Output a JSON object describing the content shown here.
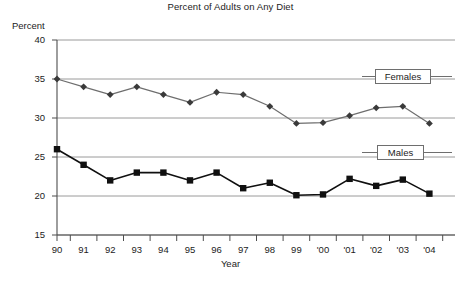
{
  "chart_data": {
    "type": "line",
    "title": "Percent of Adults on Any Diet",
    "xlabel": "Year",
    "ylabel": "Percent",
    "categories": [
      "90",
      "91",
      "92",
      "93",
      "94",
      "95",
      "96",
      "97",
      "98",
      "99",
      "'00",
      "'01",
      "'02",
      "'03",
      "'04"
    ],
    "ylim": [
      15,
      40
    ],
    "yticks": [
      15,
      20,
      25,
      30,
      35,
      40
    ],
    "ytick_labels": [
      "15",
      "20",
      "25",
      "30",
      "35",
      "40"
    ],
    "grid": "horizontal",
    "legend_position": "inline-right",
    "series": [
      {
        "name": "Females",
        "marker": "diamond",
        "color": "#6e6e6e",
        "marker_color": "#3a3a3a",
        "values": [
          35.0,
          34.0,
          33.0,
          34.0,
          33.0,
          32.0,
          33.3,
          33.0,
          31.5,
          29.3,
          29.4,
          30.3,
          31.3,
          31.5,
          29.3
        ]
      },
      {
        "name": "Males",
        "marker": "square",
        "color": "#101010",
        "marker_color": "#101010",
        "values": [
          26.0,
          24.0,
          22.0,
          23.0,
          23.0,
          22.0,
          23.0,
          21.0,
          21.7,
          20.1,
          20.2,
          22.2,
          21.3,
          22.1,
          20.3
        ]
      }
    ],
    "annotations": [
      {
        "label": "Females",
        "series": "Females"
      },
      {
        "label": "Males",
        "series": "Males"
      }
    ]
  },
  "colors": {
    "axis": "#4d4d4d",
    "grid": "#9a9a9a",
    "females_line": "#6e6e6e",
    "males_line": "#101010",
    "legend_border": "#6e6e6e",
    "text": "#1c1c1c",
    "background": "#ffffff"
  }
}
